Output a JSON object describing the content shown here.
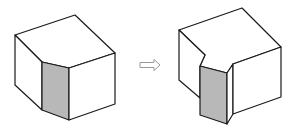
{
  "diagram": {
    "type": "isometric-block-transformation",
    "colors": {
      "background": "#ffffff",
      "line": "#1a1a1a",
      "shaded_face": "#b8b8b8",
      "arrow": "#9a9a9a"
    },
    "figures": [
      {
        "id": "before",
        "description": "block with beveled front corner, shaded bevel face"
      },
      {
        "id": "after",
        "description": "block with stepped notch at front corner, shaded recessed face"
      }
    ],
    "arrow": {
      "icon": "hollow-right-arrow",
      "direction": "right"
    }
  }
}
